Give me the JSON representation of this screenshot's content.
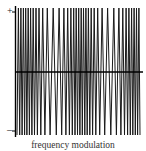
{
  "figure": {
    "caption": "frequency modulation",
    "plus_label": "+",
    "minus_label": "–"
  },
  "chart_data": {
    "type": "line",
    "title": "frequency modulation",
    "ylabels": [
      "+",
      "–"
    ],
    "amplitude": 1,
    "cycle_count_approx": 37,
    "axis": {
      "x_axis_at_zero": true,
      "y_axis_left": true
    },
    "colors": {
      "wave": "#1a1a1a",
      "axis": "#000000"
    }
  }
}
